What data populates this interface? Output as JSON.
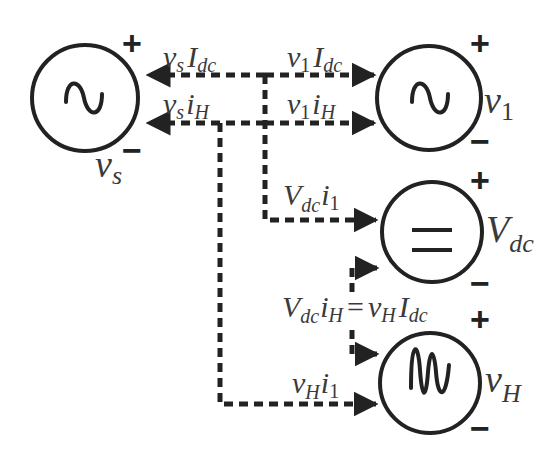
{
  "diagram": {
    "type": "power-flow-diagram",
    "colors": {
      "stroke": "#222222",
      "text": "#3a3a3a",
      "background": "#ffffff"
    },
    "sources": [
      {
        "id": "vs",
        "symbol": "sine-wave",
        "name": "v",
        "sub": "s",
        "plus": "+",
        "minus": "−"
      },
      {
        "id": "v1",
        "symbol": "sine-wave",
        "name": "v",
        "sub": "1",
        "plus": "+",
        "minus": "−"
      },
      {
        "id": "vdc",
        "symbol": "dc-equals",
        "name": "V",
        "sub": "dc",
        "plus": "+",
        "minus": "−"
      },
      {
        "id": "vh",
        "symbol": "harmonic-wave",
        "name": "v",
        "sub": "H",
        "plus": "+",
        "minus": "−"
      }
    ],
    "flows": [
      {
        "label_a": "v",
        "sub_a": "s",
        "label_b": "I",
        "sub_b": "dc",
        "direction": "to v_s"
      },
      {
        "label_a": "v",
        "sub_a": "1",
        "label_b": "I",
        "sub_b": "dc",
        "direction": "to v_1"
      },
      {
        "label_a": "v",
        "sub_a": "s",
        "label_b": "i",
        "sub_b": "H",
        "direction": "to v_s"
      },
      {
        "label_a": "v",
        "sub_a": "1",
        "label_b": "i",
        "sub_b": "H",
        "direction": "to v_1"
      },
      {
        "label_a": "V",
        "sub_a": "dc",
        "label_b": "i",
        "sub_b": "1",
        "direction": "to V_dc"
      },
      {
        "label_a": "V",
        "sub_a": "dc",
        "label_b": "i",
        "sub_b": "H",
        "eq": "=",
        "label_c": "v",
        "sub_c": "H",
        "label_d": "I",
        "sub_d": "dc",
        "direction": "both V_dc and v_H"
      },
      {
        "label_a": "v",
        "sub_a": "H",
        "label_b": "i",
        "sub_b": "1",
        "direction": "to v_H"
      }
    ]
  }
}
